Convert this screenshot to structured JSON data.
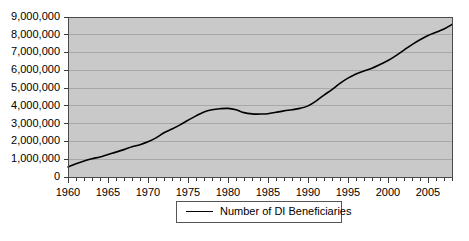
{
  "chart_data": {
    "type": "line",
    "title": "",
    "xlabel": "",
    "ylabel": "",
    "xlim": [
      1960,
      2008
    ],
    "ylim": [
      0,
      9000000
    ],
    "grid": true,
    "legend_position": "bottom-center",
    "y_ticks": [
      0,
      1000000,
      2000000,
      3000000,
      4000000,
      5000000,
      6000000,
      7000000,
      8000000,
      9000000
    ],
    "y_tick_labels": [
      "0",
      "1,000,000",
      "2,000,000",
      "3,000,000",
      "4,000,000",
      "5,000,000",
      "6,000,000",
      "7,000,000",
      "8,000,000",
      "9,000,000"
    ],
    "x_ticks": [
      1960,
      1965,
      1970,
      1975,
      1980,
      1985,
      1990,
      1995,
      2000,
      2005
    ],
    "x_tick_labels": [
      "1960",
      "1965",
      "1970",
      "1975",
      "1980",
      "1985",
      "1990",
      "1995",
      "2000",
      "2005"
    ],
    "x_minor_tick_step": 1,
    "series": [
      {
        "name": "Number of DI Beneficiaries",
        "color": "#000000",
        "x": [
          1960,
          1961,
          1962,
          1963,
          1964,
          1965,
          1966,
          1967,
          1968,
          1969,
          1970,
          1971,
          1972,
          1973,
          1974,
          1975,
          1976,
          1977,
          1978,
          1979,
          1980,
          1981,
          1982,
          1983,
          1984,
          1985,
          1986,
          1987,
          1988,
          1989,
          1990,
          1991,
          1992,
          1993,
          1994,
          1995,
          1996,
          1997,
          1998,
          1999,
          2000,
          2001,
          2002,
          2003,
          2004,
          2005,
          2006,
          2007,
          2008
        ],
        "values": [
          560000,
          740000,
          900000,
          1030000,
          1130000,
          1270000,
          1400000,
          1540000,
          1700000,
          1820000,
          1980000,
          2200000,
          2490000,
          2700000,
          2930000,
          3190000,
          3440000,
          3660000,
          3780000,
          3840000,
          3860000,
          3780000,
          3620000,
          3550000,
          3540000,
          3560000,
          3640000,
          3720000,
          3780000,
          3860000,
          4000000,
          4270000,
          4610000,
          4920000,
          5270000,
          5560000,
          5790000,
          5960000,
          6120000,
          6330000,
          6550000,
          6830000,
          7140000,
          7450000,
          7720000,
          7960000,
          8140000,
          8330000,
          8580000
        ]
      }
    ]
  },
  "legend": {
    "entries": [
      {
        "label": "Number of DI Beneficiaries"
      }
    ]
  }
}
